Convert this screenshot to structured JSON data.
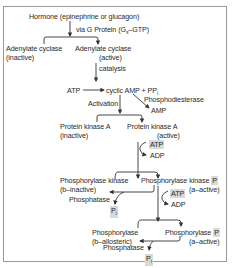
{
  "diagram": {
    "title_node": "Hormone (epinephrine or glucagon)",
    "via_label": "via G Protein (G",
    "via_sub": "s",
    "via_tail": "–GTP)",
    "adenylate_inactive": {
      "name": "Adenylate cyclase",
      "state": "(inactive)"
    },
    "adenylate_active": {
      "name": "Adenylate cyclase",
      "state": "(active)"
    },
    "catalysis": "catalysis",
    "atp1": "ATP",
    "camp": "cyclic AMP + PP",
    "camp_sub": "i",
    "phosphodiesterase": "Phosphodiesterase",
    "amp": "AMP",
    "activation": "Activation",
    "pka_inactive": {
      "name": "Protein kinase A",
      "state": "(inactive)"
    },
    "pka_active": {
      "name": "Protein kinase A",
      "state": "(active)"
    },
    "atp2": "ATP",
    "adp2": "ADP",
    "phk_inactive": {
      "name": "Phosphorylase kinase",
      "state": "(b–inactive)"
    },
    "phk_active": {
      "name": "Phosphorylase kinase",
      "p": "P",
      "state": "(a–active)"
    },
    "phosphatase1": "Phosphatase",
    "pi1": "P",
    "pi1_sub": "i",
    "atp3": "ATP",
    "adp3": "ADP",
    "ph_inactive": {
      "name": "Phosphorylase",
      "state": "(b–allosteric)"
    },
    "ph_active": {
      "name": "Phosphorylase",
      "p": "P",
      "state": "(a–active)"
    },
    "phosphatase2": "Phosphatase",
    "pi2": "P",
    "pi2_sub": "i"
  },
  "colors": {
    "line": "#333333",
    "highlight": "#d9d9d9",
    "border": "#9a9a9a"
  }
}
